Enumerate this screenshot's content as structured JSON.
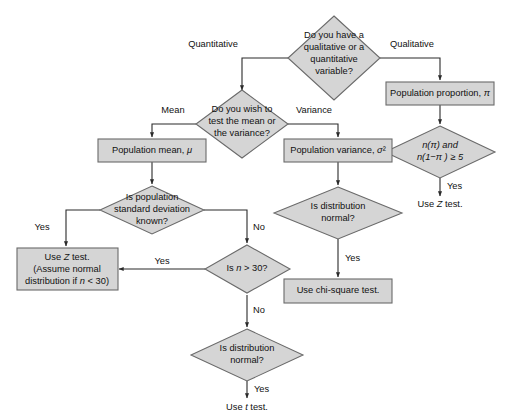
{
  "diagram": {
    "fill_color": "#d5d5d5",
    "stroke_color": "#6a6a6a",
    "connector_color": "#2a2a2a",
    "background": "#ffffff"
  },
  "nodes": {
    "start_decision": {
      "type": "decision",
      "lines": [
        "Do you have a",
        "qualitative or a",
        "quantitative",
        "variable?"
      ]
    },
    "mean_or_variance_decision": {
      "type": "decision",
      "lines": [
        "Do you wish to",
        "test the mean or",
        "the variance?"
      ]
    },
    "population_proportion": {
      "type": "process",
      "lines": [
        "Population proportion, π"
      ]
    },
    "np_condition_decision": {
      "type": "decision",
      "lines": [
        "n(π) and",
        "n(1−π ) ≥ 5"
      ]
    },
    "use_z_test_proportion": {
      "type": "terminal",
      "lines": [
        "Use Z test."
      ]
    },
    "population_mean": {
      "type": "process",
      "lines": [
        "Population mean, μ"
      ]
    },
    "population_variance": {
      "type": "process",
      "lines": [
        "Population variance, σ²"
      ]
    },
    "sigma_known_decision": {
      "type": "decision",
      "lines": [
        "Is population",
        "standard deviation",
        "known?"
      ]
    },
    "use_z_test_mean": {
      "type": "process",
      "lines": [
        "Use Z test.",
        "(Assume normal",
        "distribution if n < 30)"
      ]
    },
    "n_gt_30_decision": {
      "type": "decision",
      "lines": [
        "Is n > 30?"
      ]
    },
    "distribution_normal_mean_decision": {
      "type": "decision",
      "lines": [
        "Is distribution",
        "normal?"
      ]
    },
    "use_t_test": {
      "type": "terminal",
      "lines": [
        "Use t test."
      ]
    },
    "distribution_normal_variance_decision": {
      "type": "decision",
      "lines": [
        "Is distribution",
        "normal?"
      ]
    },
    "use_chi_square_test": {
      "type": "process",
      "lines": [
        "Use chi-square test."
      ]
    }
  },
  "edge_labels": {
    "quantitative": "Quantitative",
    "qualitative": "Qualitative",
    "mean": "Mean",
    "variance": "Variance",
    "yes_np_condition": "Yes",
    "yes_sigma_known": "Yes",
    "no_sigma_known": "No",
    "yes_n_gt_30": "Yes",
    "no_n_gt_30": "No",
    "yes_distribution_normal_mean": "Yes",
    "yes_distribution_normal_variance": "Yes"
  }
}
